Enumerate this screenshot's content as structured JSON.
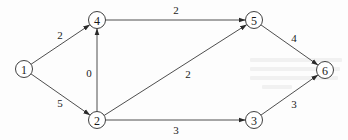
{
  "diagram": {
    "type": "directed-weighted-graph",
    "nodes": [
      {
        "id": "1",
        "label": "1",
        "x": 24,
        "y": 69
      },
      {
        "id": "2",
        "label": "2",
        "x": 97,
        "y": 120
      },
      {
        "id": "3",
        "label": "3",
        "x": 254,
        "y": 120
      },
      {
        "id": "4",
        "label": "4",
        "x": 97,
        "y": 20
      },
      {
        "id": "5",
        "label": "5",
        "x": 254,
        "y": 20
      },
      {
        "id": "6",
        "label": "6",
        "x": 325,
        "y": 70
      }
    ],
    "edges": [
      {
        "from": "1",
        "to": "4",
        "weight": "2",
        "label_x": 60,
        "label_y": 35
      },
      {
        "from": "1",
        "to": "2",
        "weight": "5",
        "label_x": 60,
        "label_y": 103
      },
      {
        "from": "2",
        "to": "4",
        "weight": "0",
        "label_x": 89,
        "label_y": 73
      },
      {
        "from": "4",
        "to": "5",
        "weight": "2",
        "label_x": 176,
        "label_y": 10
      },
      {
        "from": "2",
        "to": "5",
        "weight": "2",
        "label_x": 188,
        "label_y": 74
      },
      {
        "from": "2",
        "to": "3",
        "weight": "3",
        "label_x": 176,
        "label_y": 130
      },
      {
        "from": "5",
        "to": "6",
        "weight": "4",
        "label_x": 294,
        "label_y": 38
      },
      {
        "from": "3",
        "to": "6",
        "weight": "3",
        "label_x": 294,
        "label_y": 104
      }
    ],
    "node_radius": 8.5
  }
}
